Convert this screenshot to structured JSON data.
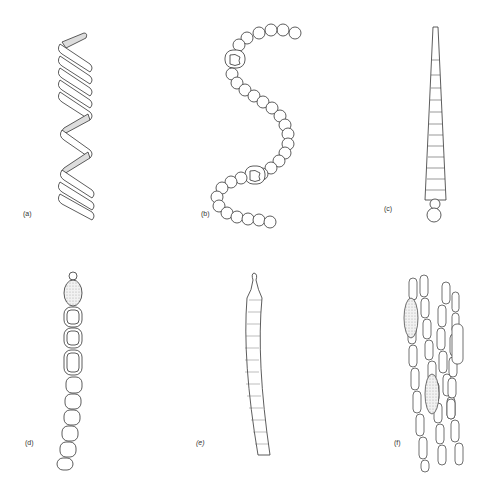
{
  "figure": {
    "panels": [
      {
        "id": "a",
        "label": "(a)",
        "subject": "helical-filament"
      },
      {
        "id": "b",
        "label": "(b)",
        "subject": "coiled-bead-chain-with-heterocysts"
      },
      {
        "id": "c",
        "label": "(c)",
        "subject": "tapering-filament"
      },
      {
        "id": "d",
        "label": "(d)",
        "subject": "bead-chain-with-akinete-and-heterocysts"
      },
      {
        "id": "e",
        "label": "(e)",
        "subject": "curved-segmented-trichome"
      },
      {
        "id": "f",
        "label": "(f)",
        "subject": "bundled-filaments-with-akinetes"
      }
    ],
    "colors": {
      "line": "#333333",
      "stipple": "#d8d8d8",
      "background": "#ffffff"
    }
  }
}
